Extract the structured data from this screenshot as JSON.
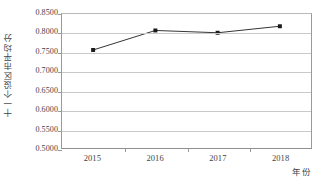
{
  "chart_data": {
    "type": "line",
    "title": "",
    "subtitle": "",
    "xlabel": "年份",
    "ylabel": "十一个设区市平均分",
    "categories": [
      "2015",
      "2016",
      "2017",
      "2018"
    ],
    "values": [
      0.756,
      0.807,
      0.801,
      0.818
    ],
    "series": [
      {
        "name": "十一个设区市平均分",
        "values": [
          0.756,
          0.807,
          0.801,
          0.818
        ]
      }
    ],
    "ylim": [
      0.5,
      0.85
    ],
    "ytick_labels": [
      "0.8500",
      "0.8000",
      "0.7500",
      "0.7000",
      "0.6500",
      "0.6000",
      "0.5500",
      "0.5000"
    ],
    "ytick_values": [
      0.85,
      0.8,
      0.75,
      0.7,
      0.65,
      0.6,
      0.55,
      0.5
    ],
    "ytick_step": 0.05,
    "xtick_labels": [
      "2015",
      "2016",
      "2017",
      "2018"
    ],
    "grid": "horizontal",
    "legend": "none",
    "marker": "square",
    "line_color": "#333333",
    "marker_color": "#1a1a1a",
    "grid_color": "#c9c9c9",
    "axis_color": "#9a9a9a",
    "text_color": "#3f3f3f",
    "background": "#ffffff"
  },
  "axes": {
    "y_title": "十一个设区市平均分",
    "x_title": "年份"
  }
}
